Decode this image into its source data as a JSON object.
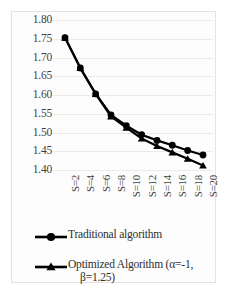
{
  "chart_data": {
    "type": "line",
    "title": "",
    "xlabel": "",
    "ylabel": "",
    "ylim": [
      1.4,
      1.8
    ],
    "ytick_values": [
      1.8,
      1.75,
      1.7,
      1.65,
      1.6,
      1.55,
      1.5,
      1.45,
      1.4
    ],
    "ytick_labels": [
      "1.80",
      "1.75",
      "1.70",
      "1.65",
      "1.60",
      "1.55",
      "1.50",
      "1.45",
      "1.40"
    ],
    "categories": [
      "S=2",
      "S=4",
      "S=6",
      "S=8",
      "S=10",
      "S=12",
      "S=14",
      "S=16",
      "S=18",
      "S=20"
    ],
    "grid": true,
    "legend_position": "bottom",
    "series": [
      {
        "name": "Traditional algorithm",
        "marker": "circle",
        "color": "#000000",
        "values": [
          1.753,
          1.672,
          1.603,
          1.547,
          1.518,
          1.494,
          1.479,
          1.466,
          1.452,
          1.44
        ]
      },
      {
        "name": "Optimized Algorithm (α=-1, β=1.25)",
        "marker": "triangle",
        "color": "#000000",
        "values": [
          1.753,
          1.672,
          1.603,
          1.543,
          1.513,
          1.484,
          1.464,
          1.447,
          1.43,
          1.412
        ]
      }
    ]
  },
  "legend": {
    "entries": [
      {
        "label": "Traditional algorithm",
        "marker": "circle"
      },
      {
        "label_line1": "Optimized Algorithm (α=-1,",
        "label_line2": "β=1.25)",
        "marker": "triangle"
      }
    ]
  }
}
